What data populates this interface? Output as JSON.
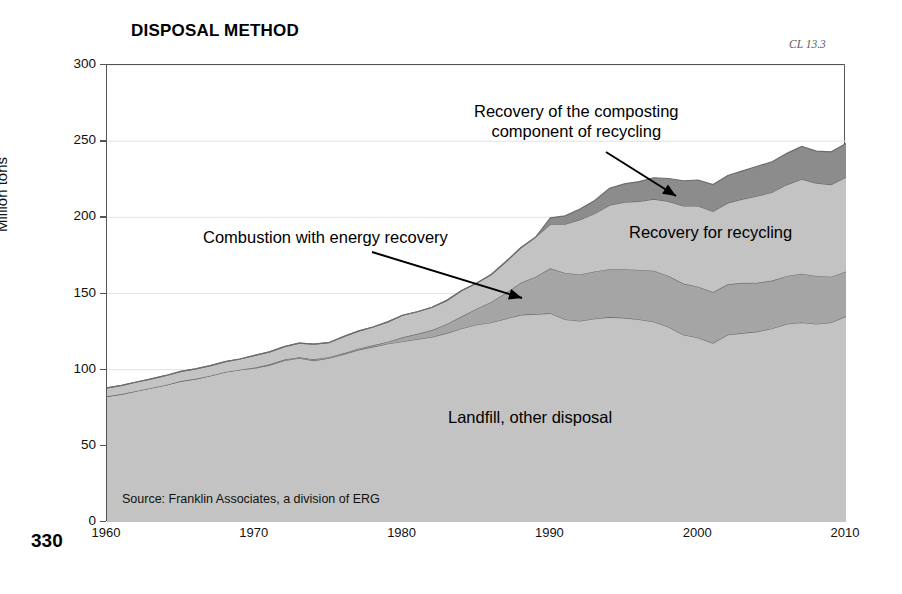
{
  "page": {
    "number": "330",
    "code": "CL 13.3"
  },
  "chart_data": {
    "type": "area",
    "title": "DISPOSAL METHOD",
    "xlabel": "",
    "ylabel": "Million tons",
    "xlim": [
      1960,
      2010
    ],
    "ylim": [
      0,
      300
    ],
    "grid": true,
    "legend_position": "inline-annotations",
    "source": "Source: Franklin Associates, a division of ERG",
    "xticks": [
      "1960",
      "1970",
      "1980",
      "1990",
      "2000",
      "2010"
    ],
    "yticks": [
      "0",
      "50",
      "100",
      "150",
      "200",
      "250",
      "300"
    ],
    "stacked": true,
    "annotations": [
      {
        "name": "composting-annotation",
        "text_line1": "Recovery of the composting",
        "text_line2": "component of recycling"
      },
      {
        "name": "combustion-annotation",
        "text_line1": "Combustion with energy recovery",
        "text_line2": ""
      },
      {
        "name": "recycling-label",
        "text_line1": "Recovery for recycling",
        "text_line2": ""
      },
      {
        "name": "landfill-label",
        "text_line1": "Landfill, other disposal",
        "text_line2": ""
      }
    ],
    "x": [
      1960,
      1961,
      1962,
      1963,
      1964,
      1965,
      1966,
      1967,
      1968,
      1969,
      1970,
      1971,
      1972,
      1973,
      1974,
      1975,
      1976,
      1977,
      1978,
      1979,
      1980,
      1981,
      1982,
      1983,
      1984,
      1985,
      1986,
      1987,
      1988,
      1989,
      1990,
      1991,
      1992,
      1993,
      1994,
      1995,
      1996,
      1997,
      1998,
      1999,
      2000,
      2001,
      2002,
      2003,
      2004,
      2005,
      2006,
      2007,
      2008,
      2009,
      2010
    ],
    "series": [
      {
        "name": "Landfill, other disposal",
        "color": "#c3c3c3",
        "values": [
          82.5,
          84.0,
          86.0,
          88.0,
          90.0,
          92.5,
          94.0,
          96.0,
          98.5,
          100.0,
          101.0,
          103.0,
          106.0,
          107.5,
          106.0,
          107.5,
          110.0,
          113.0,
          115.0,
          117.0,
          118.5,
          120.0,
          121.5,
          124.0,
          127.0,
          129.5,
          131.0,
          133.5,
          136.0,
          136.5,
          137.0,
          133.0,
          132.0,
          133.5,
          134.5,
          134.0,
          133.0,
          131.5,
          128.0,
          123.0,
          121.0,
          117.5,
          123.0,
          124.0,
          125.0,
          127.0,
          130.0,
          131.0,
          130.0,
          131.0,
          135.0
        ]
      },
      {
        "name": "Combustion with energy recovery",
        "color": "#a5a5a5",
        "values": [
          0.0,
          0.0,
          0.0,
          0.0,
          0.0,
          0.0,
          0.0,
          0.0,
          0.0,
          0.0,
          0.4,
          0.5,
          0.6,
          0.7,
          0.8,
          0.7,
          0.7,
          0.8,
          1.0,
          1.4,
          2.7,
          3.5,
          4.5,
          6.0,
          8.0,
          10.5,
          13.5,
          17.0,
          21.0,
          24.5,
          29.5,
          30.5,
          30.5,
          31.0,
          31.5,
          32.0,
          32.5,
          33.5,
          33.5,
          33.5,
          33.5,
          33.5,
          33.0,
          33.0,
          32.0,
          31.5,
          31.5,
          32.0,
          31.5,
          30.0,
          29.5
        ]
      },
      {
        "name": "Recovery for recycling",
        "color": "#c3c3c3",
        "values": [
          5.6,
          5.7,
          5.9,
          6.0,
          6.2,
          6.4,
          6.5,
          6.7,
          6.8,
          7.0,
          8.0,
          8.2,
          8.5,
          9.2,
          10.0,
          9.5,
          11.0,
          11.5,
          12.0,
          13.0,
          14.5,
          14.5,
          15.0,
          15.5,
          17.0,
          16.7,
          18.0,
          20.5,
          23.0,
          26.0,
          29.0,
          32.0,
          36.0,
          38.0,
          42.0,
          44.0,
          45.0,
          47.0,
          49.0,
          51.0,
          53.0,
          53.0,
          53.5,
          55.0,
          57.0,
          58.0,
          60.0,
          62.0,
          61.0,
          60.5,
          62.0
        ]
      },
      {
        "name": "Recovery of the composting component of recycling",
        "color": "#8c8c8c",
        "values": [
          0.0,
          0.0,
          0.0,
          0.0,
          0.0,
          0.0,
          0.0,
          0.0,
          0.0,
          0.0,
          0.0,
          0.0,
          0.0,
          0.0,
          0.0,
          0.0,
          0.0,
          0.0,
          0.0,
          0.0,
          0.0,
          0.0,
          0.0,
          0.0,
          0.0,
          0.0,
          0.0,
          0.0,
          0.0,
          0.0,
          4.2,
          5.5,
          7.0,
          8.5,
          11.0,
          12.0,
          13.0,
          14.0,
          15.0,
          16.5,
          17.0,
          17.5,
          18.0,
          18.5,
          19.5,
          20.0,
          20.5,
          21.5,
          21.0,
          21.5,
          22.0
        ]
      }
    ]
  }
}
